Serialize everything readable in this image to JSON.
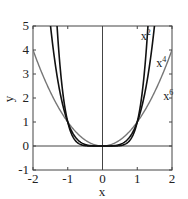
{
  "chart_data": {
    "type": "line",
    "title": "",
    "xlabel": "x",
    "ylabel": "y",
    "xlim": [
      -2,
      2
    ],
    "ylim": [
      -1,
      5
    ],
    "xticks": [
      -2,
      -1,
      0,
      1,
      2
    ],
    "yticks": [
      -1,
      0,
      1,
      2,
      3,
      4,
      5
    ],
    "xtick_labels": [
      "-2",
      "-1",
      "0",
      "1",
      "2"
    ],
    "ytick_labels": [
      "-1",
      "0",
      "1",
      "2",
      "3",
      "4",
      "5"
    ],
    "grid": false,
    "reference_lines": {
      "x": 0,
      "y": 0
    },
    "series": [
      {
        "name": "x²",
        "label_base": "x",
        "label_exp": "2",
        "exponent": 2,
        "color": "#777777",
        "width": 1.4,
        "x": [
          -2,
          -1.5,
          -1,
          -0.5,
          0,
          0.5,
          1,
          1.5,
          2
        ],
        "y": [
          4,
          2.25,
          1,
          0.25,
          0,
          0.25,
          1,
          2.25,
          4
        ]
      },
      {
        "name": "x⁴",
        "label_base": "x",
        "label_exp": "4",
        "exponent": 4,
        "color": "#111111",
        "width": 1.6,
        "x": [
          -1.5,
          -1,
          -0.5,
          0,
          0.5,
          1,
          1.5
        ],
        "y": [
          5.06,
          1,
          0.0625,
          0,
          0.0625,
          1,
          5.06
        ]
      },
      {
        "name": "x⁶",
        "label_base": "x",
        "label_exp": "6",
        "exponent": 6,
        "color": "#111111",
        "width": 1.6,
        "x": [
          -1.31,
          -1,
          -0.5,
          0,
          0.5,
          1,
          1.31
        ],
        "y": [
          5.0,
          1,
          0.0156,
          0,
          0.0156,
          1,
          5.0
        ]
      }
    ],
    "annotations": [
      {
        "text": "x⁶",
        "x": 1.1,
        "y": 4.4
      },
      {
        "text": "x⁴",
        "x": 1.55,
        "y": 3.3
      },
      {
        "text": "x²",
        "x": 1.75,
        "y": 1.9
      }
    ]
  }
}
